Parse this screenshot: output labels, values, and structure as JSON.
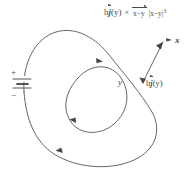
{
  "figure": {
    "type": "physics-diagram",
    "background_color": "#ffffff",
    "ink_color": "#4a4a4a"
  },
  "formula": {
    "lead_scalar": "h",
    "lead_vector": "j",
    "lead_arg": "(y)",
    "cross_symbol": "×",
    "numerator_vector": "x−y",
    "denominator": "|x−y|",
    "denominator_exponent": "3"
  },
  "labels": {
    "point_x": "x",
    "point_y": "y",
    "current_element_scalar": "h",
    "current_element_vector": "j",
    "current_element_arg": "(y)",
    "battery_plus": "+",
    "battery_minus": "−"
  },
  "elements": {
    "outer_loop": "closed current-carrying wire loop",
    "inner_loop": "inner closed loop",
    "battery": "DC voltage source on the left branch",
    "field_vector_arrow": "arrow from y to x",
    "current_direction_arrows": 3
  }
}
